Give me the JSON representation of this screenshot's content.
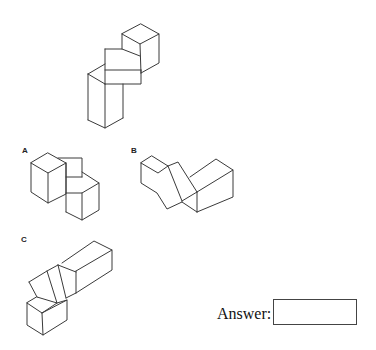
{
  "puzzle": {
    "reference_figure": "3D block assembly (reference)",
    "options": [
      {
        "label": "A"
      },
      {
        "label": "B"
      },
      {
        "label": "C"
      }
    ]
  },
  "answer": {
    "label": "Answer:",
    "value": ""
  }
}
